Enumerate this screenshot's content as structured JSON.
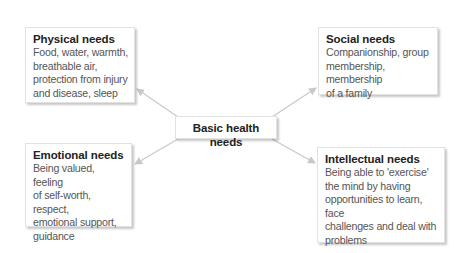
{
  "diagram": {
    "center": {
      "label": "Basic health needs"
    },
    "nodes": [
      {
        "id": "physical",
        "title": "Physical needs",
        "lines": [
          "Food, water, warmth,",
          "breathable air,",
          "protection from injury",
          "and disease, sleep"
        ]
      },
      {
        "id": "social",
        "title": "Social needs",
        "lines": [
          "Companionship, group",
          "membership, membership",
          "of a family"
        ]
      },
      {
        "id": "emotional",
        "title": "Emotional needs",
        "lines": [
          "Being valued, feeling",
          "of self-worth, respect,",
          "emotional support,",
          "guidance"
        ]
      },
      {
        "id": "intellectual",
        "title": "Intellectual needs",
        "lines": [
          "Being able to 'exercise'",
          "the mind by having",
          "opportunities to learn, face",
          "challenges and deal with",
          "problems"
        ]
      }
    ],
    "arrow_color": "#c8c8c8"
  }
}
